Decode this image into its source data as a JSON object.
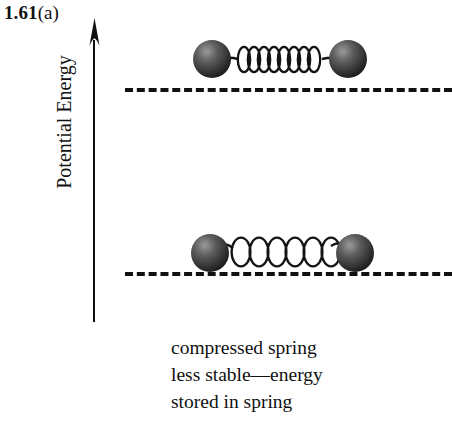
{
  "figure": {
    "number": "1.61",
    "part": "(a)"
  },
  "axis": {
    "title": "Potential Energy",
    "arrow_icon": "up-arrow-icon",
    "direction": "up"
  },
  "energy_levels": [
    {
      "name": "upper-energy-level",
      "style": "dashed"
    },
    {
      "name": "lower-energy-level",
      "style": "dashed"
    }
  ],
  "systems": [
    {
      "name": "compressed-spring-system",
      "state": "compressed",
      "coils": 8,
      "level": "upper"
    },
    {
      "name": "relaxed-spring-system",
      "state": "relaxed",
      "coils": 6,
      "level": "lower"
    }
  ],
  "caption": {
    "line1": "compressed spring",
    "line2": "less stable—energy",
    "line3": "stored in spring"
  },
  "colors": {
    "ink": "#111111",
    "sphere_dark": "#2b2b2b",
    "sphere_mid": "#4a4a4a",
    "sphere_light": "#8d8d8d",
    "background": "#ffffff"
  }
}
